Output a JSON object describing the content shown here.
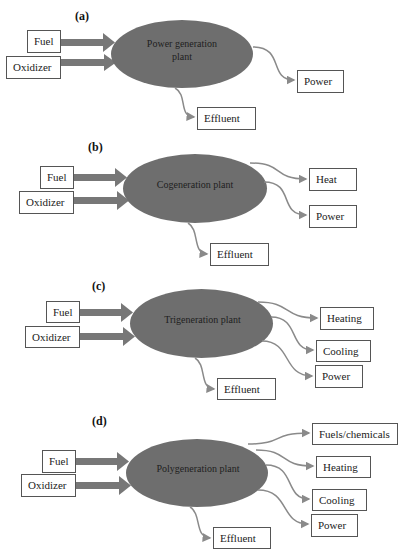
{
  "diagram": {
    "colors": {
      "ellipse_fill": "#6e6e6e",
      "input_arrow": "#777777",
      "output_arrow": "#8a8a8a",
      "box_border": "#555555"
    },
    "panels": [
      {
        "label": "(a)",
        "plant": "Power generation plant",
        "plant_lines": [
          "Power generation",
          "plant"
        ],
        "inputs": [
          "Fuel",
          "Oxidizer"
        ],
        "outputs": [
          "Power"
        ],
        "waste": "Effluent"
      },
      {
        "label": "(b)",
        "plant": "Cogeneration plant",
        "inputs": [
          "Fuel",
          "Oxidizer"
        ],
        "outputs": [
          "Heat",
          "Power"
        ],
        "waste": "Effluent"
      },
      {
        "label": "(c)",
        "plant": "Trigeneration plant",
        "inputs": [
          "Fuel",
          "Oxidizer"
        ],
        "outputs": [
          "Heating",
          "Cooling",
          "Power"
        ],
        "waste": "Effluent"
      },
      {
        "label": "(d)",
        "plant": "Polygeneration plant",
        "inputs": [
          "Fuel",
          "Oxidizer"
        ],
        "outputs": [
          "Fuels/chemicals",
          "Heating",
          "Cooling",
          "Power"
        ],
        "waste": "Effluent"
      }
    ]
  }
}
